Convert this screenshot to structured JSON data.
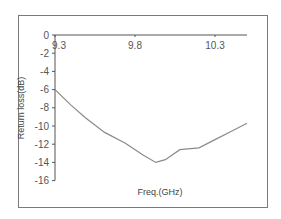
{
  "chart_data": {
    "type": "line",
    "title": "",
    "xlabel": "Freq.(GHz)",
    "ylabel": "Return loss(dB)",
    "xlim": [
      9.3,
      10.5
    ],
    "ylim": [
      -16,
      0
    ],
    "x_ticks": [
      "9.3",
      "9.8",
      "10.3"
    ],
    "y_ticks": [
      "0",
      "-2",
      "-4",
      "-6",
      "-8",
      "-10",
      "-12",
      "-14",
      "-16"
    ],
    "grid": false,
    "legend": null,
    "series": [
      {
        "name": "Return loss",
        "color": "#8a8a8a",
        "x": [
          9.3,
          9.4,
          9.49,
          9.61,
          9.74,
          9.85,
          9.93,
          9.99,
          10.08,
          10.2,
          10.3,
          10.4,
          10.5
        ],
        "y": [
          -6.0,
          -7.7,
          -9.1,
          -10.7,
          -11.9,
          -13.2,
          -14.0,
          -13.7,
          -12.6,
          -12.4,
          -11.5,
          -10.6,
          -9.7
        ]
      }
    ]
  }
}
